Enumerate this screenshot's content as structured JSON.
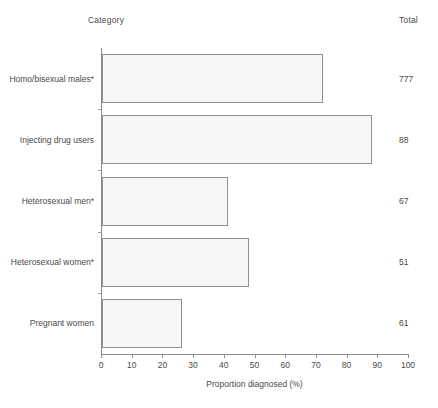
{
  "header": {
    "category_label": "Category",
    "total_label": "Total"
  },
  "footnote": "",
  "chart_data": {
    "type": "bar",
    "orientation": "horizontal",
    "title": "",
    "xlabel": "Proportion diagnosed (%)",
    "ylabel": "Category",
    "xlim": [
      0,
      100
    ],
    "xticks": [
      0,
      10,
      20,
      30,
      40,
      50,
      60,
      70,
      80,
      90,
      100
    ],
    "xtick_labels": [
      "0",
      "10",
      "20",
      "30",
      "40",
      "50",
      "60",
      "70",
      "80",
      "90",
      "100"
    ],
    "grid": false,
    "legend": null,
    "categories": [
      "Homo/bisexual males*",
      "Injecting drug users",
      "Heterosexual men*",
      "Heterosexual women*",
      "Pregnant women"
    ],
    "values": [
      72,
      88,
      41,
      48,
      26
    ],
    "totals": [
      777,
      88,
      67,
      51,
      61
    ],
    "totals_label": "Total",
    "bar_fill": "#f7f7f7",
    "bar_edge": "#909090",
    "axis_color": "#8d8d8d",
    "text_color": "#4a4a4a"
  }
}
